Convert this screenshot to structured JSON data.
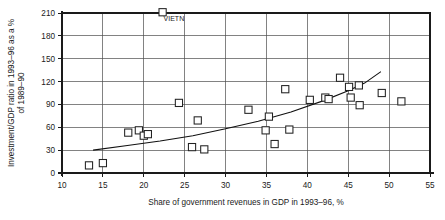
{
  "chart_data": {
    "type": "scatter",
    "title": "",
    "xlabel": "Share of government revenues in GDP in 1993–96, %",
    "ylabel": "Investment/GDP ratio in 1993–96 as a % of 1989–90",
    "xlim": [
      10,
      55
    ],
    "ylim": [
      0,
      210
    ],
    "xticks": [
      10,
      15,
      20,
      25,
      30,
      35,
      40,
      45,
      50,
      55
    ],
    "yticks": [
      0,
      30,
      60,
      90,
      120,
      150,
      180,
      210
    ],
    "xtick_labels": [
      "10",
      "15",
      "20",
      "25",
      "30",
      "35",
      "40",
      "45",
      "50",
      "55"
    ],
    "ytick_labels": [
      "0",
      "30",
      "60",
      "90",
      "120",
      "150",
      "180",
      "210"
    ],
    "grid": "horizontal-and-vertical",
    "legend": "none",
    "marker_style": "open-square",
    "points": [
      {
        "x": 13.3,
        "y": 10,
        "label": ""
      },
      {
        "x": 15.0,
        "y": 13,
        "label": ""
      },
      {
        "x": 18.1,
        "y": 53,
        "label": ""
      },
      {
        "x": 19.4,
        "y": 56,
        "label": ""
      },
      {
        "x": 20.0,
        "y": 49,
        "label": ""
      },
      {
        "x": 20.5,
        "y": 51,
        "label": ""
      },
      {
        "x": 22.3,
        "y": 211,
        "label": "VIETN"
      },
      {
        "x": 24.3,
        "y": 92,
        "label": ""
      },
      {
        "x": 25.9,
        "y": 34,
        "label": ""
      },
      {
        "x": 26.6,
        "y": 69,
        "label": ""
      },
      {
        "x": 27.4,
        "y": 31,
        "label": ""
      },
      {
        "x": 32.8,
        "y": 83,
        "label": ""
      },
      {
        "x": 34.9,
        "y": 56,
        "label": ""
      },
      {
        "x": 35.3,
        "y": 74,
        "label": ""
      },
      {
        "x": 36.0,
        "y": 38,
        "label": ""
      },
      {
        "x": 37.3,
        "y": 110,
        "label": ""
      },
      {
        "x": 37.8,
        "y": 57,
        "label": ""
      },
      {
        "x": 40.3,
        "y": 96,
        "label": ""
      },
      {
        "x": 42.2,
        "y": 99,
        "label": ""
      },
      {
        "x": 42.6,
        "y": 97,
        "label": ""
      },
      {
        "x": 44.0,
        "y": 125,
        "label": ""
      },
      {
        "x": 45.1,
        "y": 113,
        "label": ""
      },
      {
        "x": 45.3,
        "y": 99,
        "label": ""
      },
      {
        "x": 46.3,
        "y": 115,
        "label": ""
      },
      {
        "x": 46.4,
        "y": 89,
        "label": ""
      },
      {
        "x": 49.1,
        "y": 105,
        "label": ""
      },
      {
        "x": 51.5,
        "y": 94,
        "label": ""
      }
    ],
    "trend_line": {
      "type": "fitted-curve",
      "points": [
        {
          "x": 13.8,
          "y": 30
        },
        {
          "x": 18.0,
          "y": 36
        },
        {
          "x": 22.0,
          "y": 42
        },
        {
          "x": 26.0,
          "y": 49
        },
        {
          "x": 30.0,
          "y": 58
        },
        {
          "x": 34.0,
          "y": 68
        },
        {
          "x": 38.0,
          "y": 80
        },
        {
          "x": 42.0,
          "y": 95
        },
        {
          "x": 45.0,
          "y": 108
        },
        {
          "x": 47.0,
          "y": 118
        },
        {
          "x": 49.0,
          "y": 133
        }
      ]
    }
  }
}
